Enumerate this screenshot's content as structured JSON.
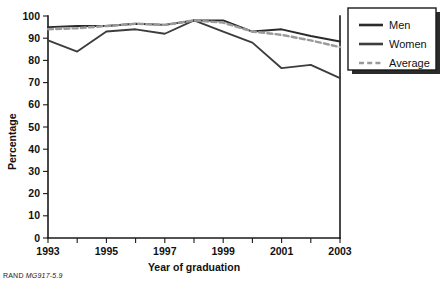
{
  "figure": {
    "footer_prefix": "RAND",
    "footer_code": "MG917-5.9",
    "title": ""
  },
  "legend": {
    "position": "top-right",
    "items": [
      {
        "label": "Men",
        "style": "solid",
        "color": "#2b2b2b"
      },
      {
        "label": "Women",
        "style": "solid",
        "color": "#3d3d3d"
      },
      {
        "label": "Average",
        "style": "dashed",
        "color": "#9a9a9a"
      }
    ]
  },
  "axes": {
    "x_title": "Year of graduation",
    "y_title": "Percentage",
    "x_tick_labels": [
      "1993",
      "1995",
      "1997",
      "1999",
      "2001",
      "2003"
    ],
    "y_tick_labels": [
      "0",
      "10",
      "20",
      "30",
      "40",
      "50",
      "60",
      "70",
      "80",
      "90",
      "100"
    ]
  },
  "chart_data": {
    "type": "line",
    "title": "",
    "xlabel": "Year of graduation",
    "ylabel": "Percentage",
    "x": [
      1993,
      1994,
      1995,
      1996,
      1997,
      1998,
      1999,
      2000,
      2001,
      2002,
      2003
    ],
    "x_tick_labels": [
      "1993",
      "1995",
      "1997",
      "1999",
      "2001",
      "2003"
    ],
    "xlim": [
      1993,
      2003
    ],
    "ylim": [
      0,
      100
    ],
    "y_ticks": [
      0,
      10,
      20,
      30,
      40,
      50,
      60,
      70,
      80,
      90,
      100
    ],
    "grid": false,
    "legend_position": "upper right",
    "series": [
      {
        "name": "Men",
        "color": "#2b2b2b",
        "style": "solid",
        "values": [
          95,
          95.5,
          95.5,
          96.5,
          96,
          98,
          98,
          93,
          94,
          91,
          88.5
        ]
      },
      {
        "name": "Women",
        "color": "#3d3d3d",
        "style": "solid",
        "values": [
          89,
          84,
          93,
          94,
          92,
          98,
          93,
          88,
          76.5,
          78,
          72
        ]
      },
      {
        "name": "Average",
        "color": "#9a9a9a",
        "style": "dashed",
        "values": [
          94,
          94.5,
          95.5,
          96.5,
          96,
          98,
          97,
          93,
          91.5,
          89,
          86
        ]
      }
    ]
  }
}
